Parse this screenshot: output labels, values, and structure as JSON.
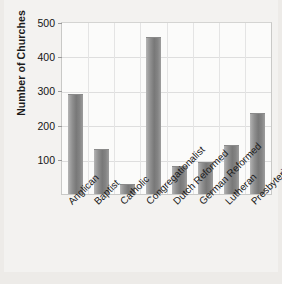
{
  "chart_data": {
    "type": "bar",
    "title": "",
    "xlabel": "",
    "ylabel": "Number of Churches",
    "ylim": [
      0,
      500
    ],
    "yticks": [
      100,
      200,
      300,
      400,
      500
    ],
    "grid": true,
    "legend": "none",
    "categories": [
      "Anglican",
      "Baptist",
      "Catholic",
      "Congregationalist",
      "Dutch Reformed",
      "German Reformed",
      "Lutheran",
      "Presbyterian"
    ],
    "values": [
      291,
      132,
      30,
      459,
      83,
      93,
      143,
      237
    ],
    "bar_color": "#7d7d7d"
  },
  "axes": {
    "y_title": "Number of Churches",
    "y_tick_labels": [
      "500",
      "400",
      "300",
      "200",
      "100"
    ]
  }
}
